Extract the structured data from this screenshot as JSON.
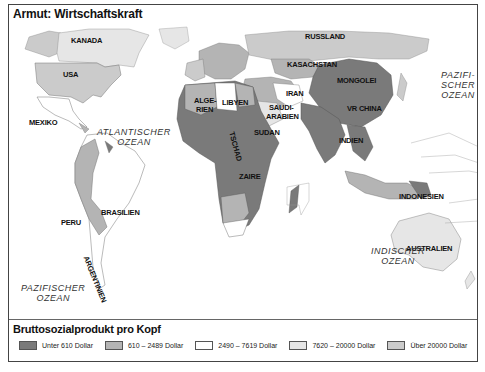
{
  "header": {
    "title": "Armut: Wirtschaftskraft"
  },
  "map": {
    "copyright": "© Harenberg",
    "countries": [
      {
        "name": "KANADA",
        "x": 62,
        "y": 14
      },
      {
        "name": "USA",
        "x": 54,
        "y": 48
      },
      {
        "name": "MEXIKO",
        "x": 20,
        "y": 96
      },
      {
        "name": "BRASILIEN",
        "x": 92,
        "y": 186
      },
      {
        "name": "PERU",
        "x": 52,
        "y": 196
      },
      {
        "name": "RUSSLAND",
        "x": 296,
        "y": 10
      },
      {
        "name": "KASACHSTAN",
        "x": 278,
        "y": 38
      },
      {
        "name": "MONGOLEI",
        "x": 328,
        "y": 54
      },
      {
        "name": "VR CHINA",
        "x": 338,
        "y": 82
      },
      {
        "name": "INDIEN",
        "x": 330,
        "y": 114
      },
      {
        "name": "IRAN",
        "x": 277,
        "y": 67
      },
      {
        "name": "SAUDI-",
        "x": 260,
        "y": 81
      },
      {
        "name": "ARABIEN",
        "x": 257,
        "y": 90
      },
      {
        "name": "ALGE-",
        "x": 185,
        "y": 74
      },
      {
        "name": "RIEN",
        "x": 187,
        "y": 83
      },
      {
        "name": "LIBYEN",
        "x": 213,
        "y": 76
      },
      {
        "name": "SUDAN",
        "x": 245,
        "y": 106
      },
      {
        "name": "ZAIRE",
        "x": 230,
        "y": 150
      },
      {
        "name": "INDONESIEN",
        "x": 390,
        "y": 170
      },
      {
        "name": "AUSTRALIEN",
        "x": 397,
        "y": 222
      }
    ],
    "rotated_labels": [
      {
        "name": "TSCHAD",
        "x": 226,
        "y": 108,
        "rotate": 75
      },
      {
        "name": "ARGENTINIEN",
        "x": 80,
        "y": 232,
        "rotate": 68
      }
    ],
    "oceans": [
      {
        "name": "ATLANTISCHER\nOZEAN",
        "x": 88,
        "y": 104
      },
      {
        "name": "PAZIFI-\nSCHER\nOZEAN",
        "x": 432,
        "y": 47
      },
      {
        "name": "INDISCHER\nOZEAN",
        "x": 362,
        "y": 223
      },
      {
        "name": "PAZIFISCHER\nOZEAN",
        "x": 12,
        "y": 260
      }
    ]
  },
  "legend": {
    "title": "Bruttosozialprodukt pro Kopf",
    "items": [
      {
        "label": "Unter 610 Dollar",
        "color": "#7a7a7a"
      },
      {
        "label": "610 – 2489 Dollar",
        "color": "#b4b4b4"
      },
      {
        "label": "2490 – 7619 Dollar",
        "color": "#ffffff"
      },
      {
        "label": "7620 – 20000 Dollar",
        "color": "#e6e6e6"
      },
      {
        "label": "Über 20000 Dollar",
        "color": "#cbcbcb"
      }
    ]
  }
}
